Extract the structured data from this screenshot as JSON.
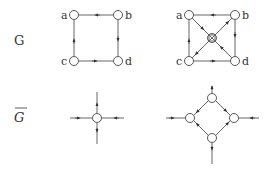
{
  "labels": {
    "row1": "G",
    "row2": "G"
  },
  "graphs": {
    "g_left": {
      "nodes": [
        {
          "id": "a",
          "label": "a",
          "x": 74,
          "y": 15
        },
        {
          "id": "b",
          "label": "b",
          "x": 118,
          "y": 15
        },
        {
          "id": "c",
          "label": "c",
          "x": 74,
          "y": 61
        },
        {
          "id": "d",
          "label": "d",
          "x": 118,
          "y": 61
        }
      ],
      "edges": [
        {
          "from": "b",
          "to": "a"
        },
        {
          "from": "b",
          "to": "d"
        },
        {
          "from": "c",
          "to": "d"
        },
        {
          "from": "c",
          "to": "a"
        }
      ]
    },
    "g_right": {
      "nodes": [
        {
          "id": "a",
          "label": "a",
          "x": 189,
          "y": 15
        },
        {
          "id": "b",
          "label": "b",
          "x": 235,
          "y": 15
        },
        {
          "id": "c",
          "label": "c",
          "x": 189,
          "y": 61
        },
        {
          "id": "d",
          "label": "d",
          "x": 235,
          "y": 61
        },
        {
          "id": "x",
          "label": "",
          "x": 212,
          "y": 38,
          "shape": "crossed-square"
        }
      ],
      "edges": [
        {
          "from": "b",
          "to": "a"
        },
        {
          "from": "b",
          "to": "d"
        },
        {
          "from": "c",
          "to": "d"
        },
        {
          "from": "c",
          "to": "a"
        },
        {
          "from": "a",
          "to": "x"
        },
        {
          "from": "x",
          "to": "b"
        },
        {
          "from": "x",
          "to": "c"
        },
        {
          "from": "d",
          "to": "x"
        }
      ]
    },
    "gbar_left": {
      "nodes": [
        {
          "id": "n",
          "x": 97,
          "y": 118
        }
      ],
      "edges": [
        {
          "from": "n",
          "to": "up"
        },
        {
          "from": "n",
          "to": "down"
        },
        {
          "from": "left",
          "to": "n"
        },
        {
          "from": "right",
          "to": "n"
        }
      ]
    },
    "gbar_right": {
      "nodes": [
        {
          "id": "top",
          "x": 212,
          "y": 98
        },
        {
          "id": "left",
          "x": 190,
          "y": 118
        },
        {
          "id": "right",
          "x": 234,
          "y": 118
        },
        {
          "id": "bottom",
          "x": 212,
          "y": 138
        }
      ],
      "edges": [
        {
          "from": "top",
          "to": "up"
        },
        {
          "from": "bottom",
          "to": "down"
        },
        {
          "from": "ext-left",
          "to": "left"
        },
        {
          "from": "ext-right",
          "to": "right"
        },
        {
          "from": "left",
          "to": "top"
        },
        {
          "from": "top",
          "to": "right"
        },
        {
          "from": "bottom",
          "to": "left"
        },
        {
          "from": "right",
          "to": "bottom"
        }
      ]
    }
  }
}
